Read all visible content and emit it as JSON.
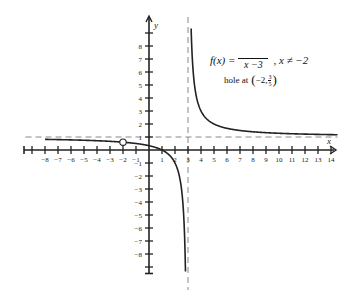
{
  "chart_data": {
    "type": "line",
    "title": "",
    "function_label": "f(x) =",
    "function_numerator": "",
    "function_denominator": "x −3",
    "function_condition": ", x ≠ −2",
    "hole_text": "hole at",
    "hole_point": {
      "x": -2,
      "y_num": "3",
      "y_den": "5",
      "y": 0.6,
      "display_x": "−2,"
    },
    "xlabel": "x",
    "ylabel": "y",
    "xlim": [
      -9,
      14
    ],
    "ylim": [
      -9,
      9
    ],
    "x_ticks": [
      -8,
      -7,
      -6,
      -5,
      -4,
      -3,
      -2,
      -1,
      1,
      2,
      3,
      4,
      5,
      6,
      7,
      8,
      9,
      10,
      11,
      12,
      13,
      14
    ],
    "x_tick_labels": [
      "−8",
      "−7",
      "−6",
      "−5",
      "−4",
      "−3",
      "−2",
      "−1",
      "1",
      "2",
      "3",
      "4",
      "5",
      "6",
      "7",
      "8",
      "9",
      "10",
      "11",
      "12",
      "13",
      "14"
    ],
    "y_ticks": [
      8,
      7,
      6,
      5,
      4,
      3,
      2,
      1,
      -1,
      -2,
      -3,
      -4,
      -5,
      -6,
      -7,
      -8
    ],
    "y_tick_labels": [
      "8",
      "7",
      "6",
      "5",
      "4",
      "3",
      "2",
      "1",
      "−1",
      "−2",
      "−3",
      "−4",
      "−5",
      "−6",
      "−7",
      "−8"
    ],
    "asymptotes": {
      "vertical": 3,
      "horizontal": 1
    },
    "series": [
      {
        "name": "f(x) = (x−1)/(x−3) branch left",
        "x_range": [
          -8,
          2.9
        ],
        "zero_at": 1
      },
      {
        "name": "f(x) branch right",
        "x_range": [
          3.1,
          14
        ]
      }
    ],
    "grid": false,
    "legend": "none"
  }
}
